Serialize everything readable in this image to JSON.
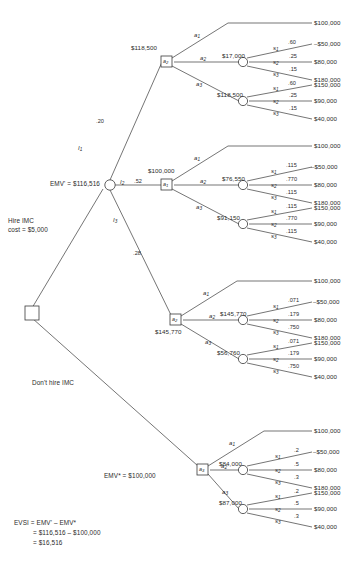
{
  "diagram": {
    "type": "decision-tree",
    "root": {
      "name": "root-decision-node",
      "shape": "square"
    },
    "left_labels": {
      "emv_prime": "EMV' = $116,516",
      "hire_line1": "Hire IMC",
      "hire_line2": "cost = $5,000",
      "dont_hire": "Don't hire IMC",
      "emv_star": "EMV* = $100,000"
    },
    "evsi": {
      "line1": "EVSI = EMV' – EMV*",
      "line2": "= $116,516 – $100,000",
      "line3": "= $16,516"
    },
    "info_branches": [
      {
        "label": "I",
        "sub": "1",
        "prob": ".20"
      },
      {
        "label": "I",
        "sub": "2",
        "prob": ".52"
      },
      {
        "label": "I",
        "sub": "3",
        "prob": ".28"
      }
    ],
    "actions": [
      {
        "label": "a",
        "sub": "1"
      },
      {
        "label": "a",
        "sub": "2"
      },
      {
        "label": "a",
        "sub": "3"
      }
    ],
    "states": [
      {
        "label": "s",
        "sub": "1"
      },
      {
        "label": "s",
        "sub": "2"
      },
      {
        "label": "s",
        "sub": "3"
      }
    ],
    "decision_nodes": [
      {
        "name": "a2-node-top",
        "label": "a",
        "sub": "2",
        "value": "$118,500",
        "value_pos": "above"
      },
      {
        "name": "a1-node-second",
        "label": "a",
        "sub": "1",
        "value": "$100,000",
        "value_pos": "above"
      },
      {
        "name": "a2-node-third",
        "label": "a",
        "sub": "2",
        "value": "$145,770",
        "value_pos": "below"
      },
      {
        "name": "a3-node-bottom",
        "label": "a",
        "sub": "3",
        "value": "",
        "value_pos": "none"
      }
    ],
    "branches": [
      {
        "name": "branch-i1",
        "info": "I1",
        "prob": ".20",
        "decision_value": "$118,500",
        "a1_payoff": "$100,000",
        "chance_nodes": [
          {
            "name": "chance-i1-a2",
            "ev": "$17,000",
            "outcomes": [
              {
                "state": "s1",
                "prob": ".60",
                "payoff": "–$50,000"
              },
              {
                "state": "s2",
                "prob": ".25",
                "payoff": "$80,000"
              },
              {
                "state": "s3",
                "prob": ".15",
                "payoff": "$180,000"
              }
            ]
          },
          {
            "name": "chance-i1-a3",
            "ev": "$118,500",
            "outcomes": [
              {
                "state": "s1",
                "prob": ".60",
                "payoff": "$150,000"
              },
              {
                "state": "s2",
                "prob": ".25",
                "payoff": "$90,000"
              },
              {
                "state": "s3",
                "prob": ".15",
                "payoff": "$40,000"
              }
            ]
          }
        ]
      },
      {
        "name": "branch-i2",
        "info": "I2",
        "prob": ".52",
        "decision_value": "$100,000",
        "a1_payoff": "$100,000",
        "chance_nodes": [
          {
            "name": "chance-i2-a2",
            "ev": "$76,550",
            "outcomes": [
              {
                "state": "s1",
                "prob": ".115",
                "payoff": "–$50,000"
              },
              {
                "state": "s2",
                "prob": ".770",
                "payoff": "$80,000"
              },
              {
                "state": "s3",
                "prob": ".115",
                "payoff": "$180,000"
              }
            ]
          },
          {
            "name": "chance-i2-a3",
            "ev": "$91,150",
            "outcomes": [
              {
                "state": "s1",
                "prob": ".115",
                "payoff": "$150,000"
              },
              {
                "state": "s2",
                "prob": ".770",
                "payoff": "$90,000"
              },
              {
                "state": "s3",
                "prob": ".115",
                "payoff": "$40,000"
              }
            ]
          }
        ]
      },
      {
        "name": "branch-i3",
        "info": "I3",
        "prob": ".28",
        "decision_value": "$145,770",
        "a1_payoff": "$100,000",
        "chance_nodes": [
          {
            "name": "chance-i3-a2",
            "ev": "$145,770",
            "outcomes": [
              {
                "state": "s1",
                "prob": ".071",
                "payoff": "–$50,000"
              },
              {
                "state": "s2",
                "prob": ".179",
                "payoff": "$80,000"
              },
              {
                "state": "s3",
                "prob": ".750",
                "payoff": "$180,000"
              }
            ]
          },
          {
            "name": "chance-i3-a3",
            "ev": "$56,760",
            "outcomes": [
              {
                "state": "s1",
                "prob": ".071",
                "payoff": "$150,000"
              },
              {
                "state": "s2",
                "prob": ".179",
                "payoff": "$90,000"
              },
              {
                "state": "s3",
                "prob": ".750",
                "payoff": "$40,000"
              }
            ]
          }
        ]
      },
      {
        "name": "branch-no-info",
        "info": "",
        "prob": "",
        "decision_value": "",
        "a1_payoff": "$100,000",
        "chance_nodes": [
          {
            "name": "chance-noinfo-a2",
            "ev": "$84,000",
            "outcomes": [
              {
                "state": "s1",
                "prob": ".2",
                "payoff": "–$50,000"
              },
              {
                "state": "s2",
                "prob": ".5",
                "payoff": "$80,000"
              },
              {
                "state": "s3",
                "prob": ".3",
                "payoff": "$180,000"
              }
            ]
          },
          {
            "name": "chance-noinfo-a3",
            "ev": "$87,000",
            "outcomes": [
              {
                "state": "s1",
                "prob": ".2",
                "payoff": "$150,000"
              },
              {
                "state": "s2",
                "prob": ".5",
                "payoff": "$90,000"
              },
              {
                "state": "s3",
                "prob": ".3",
                "payoff": "$40,000"
              }
            ]
          }
        ]
      }
    ],
    "colors": {
      "stroke": "#3a3a3a",
      "text": "#2b2b2b",
      "background": "#ffffff"
    }
  }
}
